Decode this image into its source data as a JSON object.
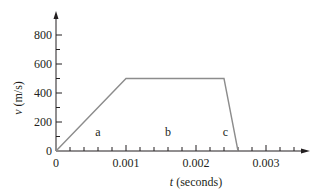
{
  "chart_data": {
    "type": "line",
    "title": "",
    "xlabel_var": "t",
    "xlabel_unit": " (seconds)",
    "ylabel_var": "v",
    "ylabel_unit": " (m/s)",
    "xlim": [
      0,
      0.0035
    ],
    "ylim": [
      0,
      900
    ],
    "x_ticks": [
      0,
      0.001,
      0.002,
      0.003
    ],
    "x_tick_labels": [
      "0",
      "0.001",
      "0.002",
      "0.003"
    ],
    "x_minor_step": 0.0002,
    "y_ticks": [
      0,
      200,
      400,
      600,
      800
    ],
    "y_tick_labels": [
      "0",
      "200",
      "400",
      "600",
      "800"
    ],
    "y_minor_step": 100,
    "grid": false,
    "legend": null,
    "series": [
      {
        "name": "velocity",
        "color": "#8c8c8c",
        "x": [
          0,
          0.001,
          0.0024,
          0.0026
        ],
        "y": [
          0,
          500,
          500,
          0
        ]
      }
    ],
    "annotations": [
      {
        "text": "a",
        "x": 0.0006,
        "y": 100
      },
      {
        "text": "b",
        "x": 0.0016,
        "y": 100
      },
      {
        "text": "c",
        "x": 0.00242,
        "y": 100
      }
    ]
  }
}
